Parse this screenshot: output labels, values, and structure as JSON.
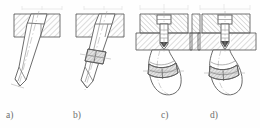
{
  "figure": {
    "kind": "engineering-cross-section-set",
    "panel_count": 4,
    "labels": [
      "a)",
      "b)",
      "c)",
      "d)"
    ],
    "colors": {
      "background": "#fefefe",
      "outline": "#5a5a5a",
      "hatch": "#9a9a9a",
      "centerline": "#a8a8a8",
      "label_text": "#6d6d6d",
      "fill_part": "#ffffff",
      "fill_collar": "#e3e3e3"
    },
    "panels": [
      {
        "id": "a",
        "label": "a)",
        "description": "Inclined cylindrical pin seated in a hatched plate, plain shank with chamfered conical tip, no collar",
        "features": [
          "hatched-plate",
          "inclined-pin",
          "stepped-head",
          "chamfered-tip",
          "centerline"
        ],
        "has_collar": false,
        "has_bolt_head": false,
        "pin_angle_deg": 20
      },
      {
        "id": "b",
        "label": "b)",
        "description": "Inclined cylindrical pin in a hatched plate with a hatched split collar clamped on the protruding shank",
        "features": [
          "hatched-plate",
          "inclined-pin",
          "stepped-head",
          "hatched-collar",
          "chamfered-tip",
          "centerline"
        ],
        "has_collar": true,
        "has_bolt_head": false,
        "pin_angle_deg": 20
      },
      {
        "id": "c",
        "label": "c)",
        "description": "Vertical hex bolt through two hatched plates clamping a bent flexible member that curves down, with hatched collar band",
        "features": [
          "hatched-plate-upper",
          "hatched-plate-lower",
          "vertical-bolt",
          "bolt-head",
          "conical-tip",
          "bent-member",
          "hatched-collar",
          "rounded-end",
          "centerline"
        ],
        "has_collar": true,
        "has_bolt_head": true,
        "pin_angle_deg": 0
      },
      {
        "id": "d",
        "label": "d)",
        "description": "Vertical hex bolt through two hatched plates with a conical seat, bent member curving down, hatched collar band and rounded closed end",
        "features": [
          "hatched-plate-upper",
          "hatched-plate-lower",
          "vertical-bolt",
          "bolt-head",
          "conical-seat",
          "bent-member",
          "hatched-collar",
          "rounded-end",
          "centerline"
        ],
        "has_collar": true,
        "has_bolt_head": true,
        "pin_angle_deg": 0
      }
    ],
    "top_artifacts": {
      "description": "Faint cropped dimension lines and tick marks along the top edge, remnants of a larger sheet",
      "visible": true
    }
  }
}
